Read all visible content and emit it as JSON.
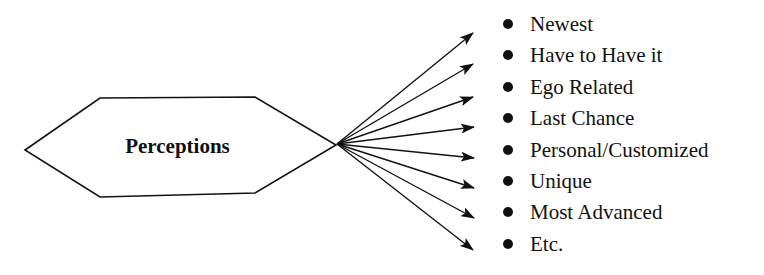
{
  "diagram": {
    "center_label": "Perceptions",
    "items": [
      {
        "label": "Newest"
      },
      {
        "label": "Have to Have it"
      },
      {
        "label": "Ego Related"
      },
      {
        "label": "Last Chance"
      },
      {
        "label": "Personal/Customized"
      },
      {
        "label": "Unique"
      },
      {
        "label": "Most Advanced"
      },
      {
        "label": "Etc."
      }
    ],
    "colors": {
      "stroke": "#111111",
      "background": "#ffffff"
    }
  }
}
